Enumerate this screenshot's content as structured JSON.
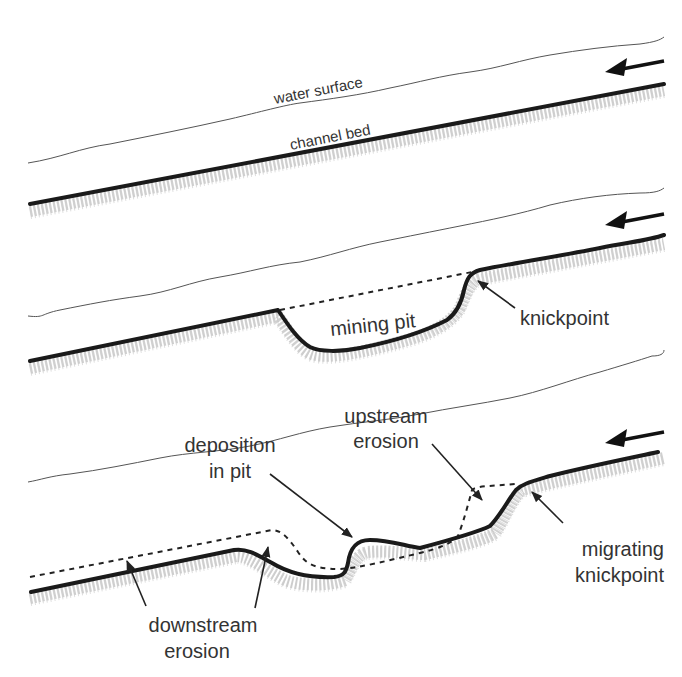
{
  "figure": {
    "panels": [
      {
        "id": "panel-1",
        "labels": {
          "water_surface": "water surface",
          "channel_bed": "channel bed"
        },
        "flow_direction": "right-to-left"
      },
      {
        "id": "panel-2",
        "labels": {
          "pit": "mining pit",
          "knickpoint": "knickpoint"
        },
        "flow_direction": "right-to-left"
      },
      {
        "id": "panel-3",
        "labels": {
          "deposition_line1": "deposition",
          "deposition_line2": "in pit",
          "upstream_line1": "upstream",
          "upstream_line2": "erosion",
          "migrating_line1": "migrating",
          "migrating_line2": "knickpoint",
          "downstream_line1": "downstream",
          "downstream_line2": "erosion"
        },
        "flow_direction": "right-to-left"
      }
    ],
    "legend_styles": {
      "water_surface": "thin grey line",
      "channel_bed": "thick black line",
      "original_bed": "dashed line",
      "sediment": "grey stippled texture"
    }
  }
}
